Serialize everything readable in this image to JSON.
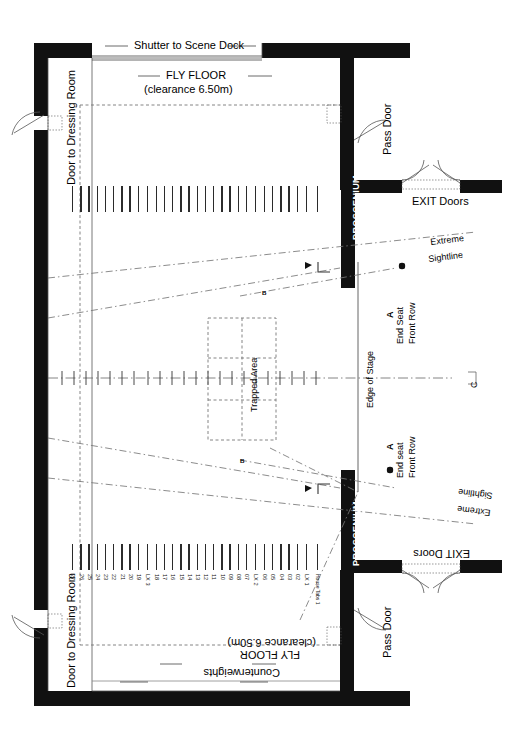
{
  "drawing": {
    "title": "Theatre Stage Plan",
    "type": "architectural-floor-plan"
  },
  "labels": {
    "shutter_scene_dock": "Shutter to Scene Dock",
    "fly_floor": "FLY FLOOR",
    "clearance": "(clearance 6.50m)",
    "door_dressing_room": "Door to Dressing Room",
    "pass_door": "Pass Door",
    "exit_doors": "EXIT Doors",
    "proscenium": "PROSCENIUM",
    "extreme_sightline": "Extreme Sightline",
    "extreme": "Extreme",
    "sightline": "Sightline",
    "end_seat_front_row_upper": "End Seat Front Row",
    "end_seat_upper_l1": "End Seat",
    "end_seat_upper_l2": "Front Row",
    "end_seat_lower_l1": "End seat",
    "end_seat_lower_l2": "Front Row",
    "edge_of_stage": "Edge of Stage",
    "trapped_area": "Trapped Area",
    "counterweights": "Counterweights",
    "centerline_mark": "C",
    "sightline_a": "A",
    "sightline_b": "B",
    "house_tabs": "House Tabs 1"
  },
  "fly_bars": {
    "sets": [
      {
        "name": "upstage-numbers",
        "items": [
          "27",
          "26",
          "25",
          "24",
          "23",
          "22",
          "21",
          "20",
          "19"
        ]
      },
      {
        "name": "lx3",
        "items": [
          "LX 3"
        ]
      },
      {
        "name": "mid-numbers",
        "items": [
          "18",
          "17",
          "16",
          "15",
          "14",
          "13",
          "12",
          "11",
          "10",
          "09",
          "08",
          "07"
        ]
      },
      {
        "name": "lx2",
        "items": [
          "LX 2"
        ]
      },
      {
        "name": "downstage-numbers",
        "items": [
          "06",
          "05",
          "04",
          "03",
          "02"
        ]
      },
      {
        "name": "lx1",
        "items": [
          "LX 1"
        ]
      },
      {
        "name": "house-tabs",
        "items": [
          "House Tabs 1"
        ]
      }
    ],
    "full_order": [
      "27",
      "26",
      "25",
      "24",
      "23",
      "22",
      "21",
      "20",
      "19",
      "LX 3",
      "18",
      "17",
      "16",
      "15",
      "14",
      "13",
      "12",
      "11",
      "10",
      "09",
      "08",
      "07",
      "LX 2",
      "06",
      "05",
      "04",
      "03",
      "02",
      "LX 1",
      "House Tabs 1"
    ]
  },
  "colors": {
    "wall": "#111111",
    "line": "#444444",
    "dash": "#777777",
    "background": "#ffffff",
    "bar": "#2b2b2b"
  }
}
